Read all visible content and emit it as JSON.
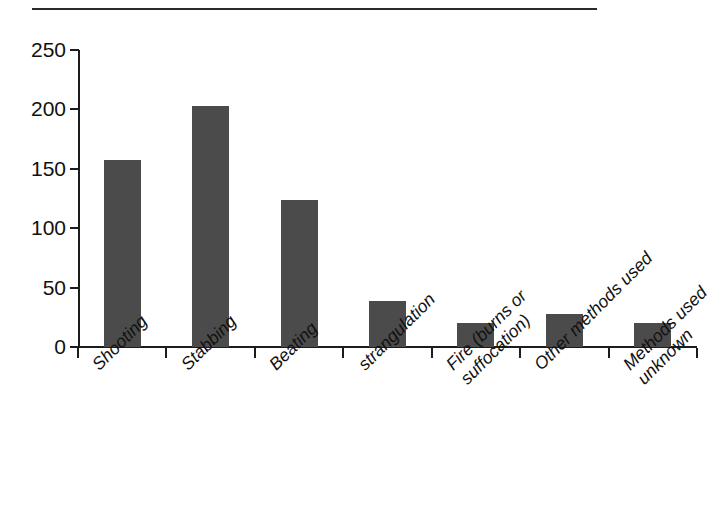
{
  "figure": {
    "has_top_rule": true,
    "background_color": "#ffffff",
    "bar_color": "#4b4b4b",
    "axis_color": "#1c1c1c"
  },
  "chart_data": {
    "type": "bar",
    "title": "",
    "subtitle": "",
    "xlabel": "",
    "ylabel": "",
    "ylim": [
      0,
      250
    ],
    "yticks": [
      0,
      50,
      100,
      150,
      200,
      250
    ],
    "ytick_labels": [
      "0",
      "50",
      "100",
      "150",
      "200",
      "250"
    ],
    "grid": false,
    "legend": null,
    "categories": [
      "Shooting",
      "Stabbing",
      "Beating",
      "strangulation",
      "Fire (burns or suffocation)",
      "Other methods used",
      "Methods used unknown"
    ],
    "category_lines": [
      [
        "Shooting"
      ],
      [
        "Stabbing"
      ],
      [
        "Beating"
      ],
      [
        "strangulation"
      ],
      [
        "Fire (burns or",
        "suffocation)"
      ],
      [
        "Other methods used"
      ],
      [
        "Methods used",
        "unknown"
      ]
    ],
    "values": [
      157,
      203,
      124,
      39,
      20,
      28,
      20
    ],
    "tick_label_rotation": -45
  }
}
